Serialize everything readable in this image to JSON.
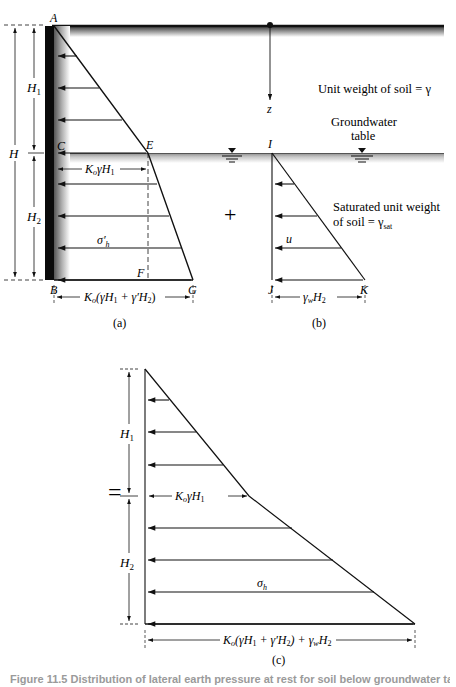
{
  "figure": {
    "panel_a": {
      "points": {
        "A": "A",
        "C": "C",
        "E": "E",
        "F": "F",
        "B": "B",
        "G": "G"
      },
      "dims": {
        "H": "H",
        "H1": "H",
        "H1_sub": "1",
        "H2": "H",
        "H2_sub": "2"
      },
      "labels": {
        "ko_gamma_h1": "K",
        "ko_sub": "o",
        "ko_gamma_h1_rest": "γH",
        "ko_gamma_h1_sub": "1",
        "sigma_h_prime": "σ′",
        "sigma_h_prime_sub": "h",
        "base_width": "K",
        "base_width_sub": "o",
        "base_width_rest": "(γH",
        "base_width_sub1": "1",
        "base_width_mid": " + γ′H",
        "base_width_sub2": "2",
        "base_width_end": ")"
      },
      "panel_label": "(a)"
    },
    "panel_b": {
      "points": {
        "I": "I",
        "J": "J",
        "K": "K"
      },
      "labels": {
        "u": "u",
        "gamma_w": "γ",
        "gamma_w_sub": "w",
        "gamma_w_rest": "H",
        "gamma_w_sub2": "2"
      },
      "panel_label": "(b)"
    },
    "panel_c": {
      "dims": {
        "H1": "H",
        "H1_sub": "1",
        "H2": "H",
        "H2_sub": "2"
      },
      "labels": {
        "ko_gamma_h1": "K",
        "ko_sub": "o",
        "ko_gamma_h1_rest": "γH",
        "ko_gamma_h1_sub": "1",
        "sigma_h": "σ",
        "sigma_h_sub": "h",
        "base_width": "K",
        "base_width_sub": "o",
        "base_width_rest": "(γH",
        "base_width_sub1": "1",
        "base_width_mid": " + γ′H",
        "base_width_sub2": "2",
        "base_width_end": ") + γ",
        "base_width_sub3": "w",
        "base_width_end2": "H",
        "base_width_sub4": "2"
      },
      "panel_label": "(c)"
    },
    "annotations": {
      "z_axis": "z",
      "unit_weight": "Unit weight of soil = γ",
      "groundwater_line1": "Groundwater",
      "groundwater_line2": "table",
      "sat_line1": "Saturated unit weight",
      "sat_line2": "of soil = γ",
      "sat_sub": "sat",
      "plus": "+",
      "equals": "="
    },
    "caption": "Figure 11.5 Distribution of lateral earth pressure at rest for soil below groundwater table"
  }
}
